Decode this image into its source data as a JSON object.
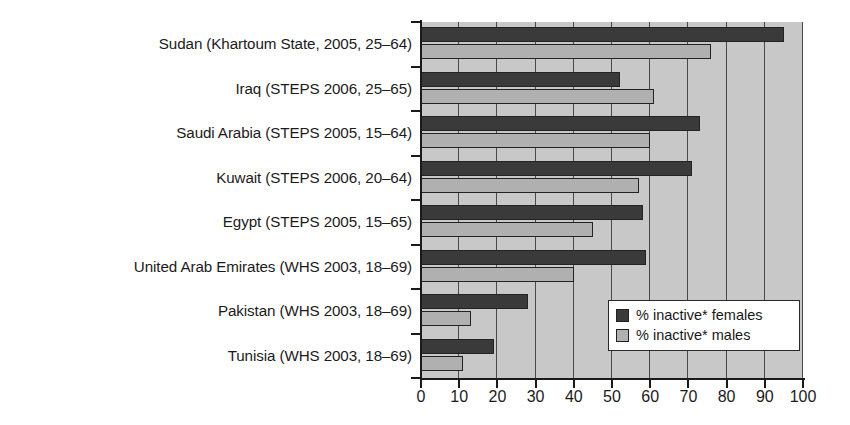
{
  "chart_data": {
    "type": "bar",
    "orientation": "horizontal",
    "title": "",
    "xlabel": "",
    "ylabel": "",
    "xlim": [
      0,
      100
    ],
    "xticks": [
      0,
      10,
      20,
      30,
      40,
      50,
      60,
      70,
      80,
      90,
      100
    ],
    "grid": true,
    "grid_axis": "x",
    "legend_position": "bottom-right",
    "categories": [
      "Sudan (Khartoum State, 2005, 25–64)",
      "Iraq (STEPS 2006, 25–65)",
      "Saudi Arabia (STEPS 2005, 15–64)",
      "Kuwait (STEPS 2006, 20–64)",
      "Egypt (STEPS 2005, 15–65)",
      "United Arab Emirates (WHS 2003, 18–69)",
      "Pakistan (WHS 2003, 18–69)",
      "Tunisia (WHS 2003, 18–69)"
    ],
    "series": [
      {
        "name": "% inactive* females",
        "color": "#3a3a3a",
        "values": [
          95,
          52,
          73,
          71,
          58,
          59,
          28,
          19
        ]
      },
      {
        "name": "% inactive* males",
        "color": "#b0b0b0",
        "values": [
          76,
          61,
          60,
          57,
          45,
          40,
          13,
          11
        ]
      }
    ]
  },
  "legend": {
    "items": [
      {
        "label": "% inactive* females",
        "swatch": "female"
      },
      {
        "label": "% inactive* males",
        "swatch": "male"
      }
    ]
  },
  "axis": {
    "x_tick_labels": [
      "0",
      "10",
      "20",
      "30",
      "40",
      "50",
      "60",
      "70",
      "80",
      "90",
      "100"
    ]
  }
}
